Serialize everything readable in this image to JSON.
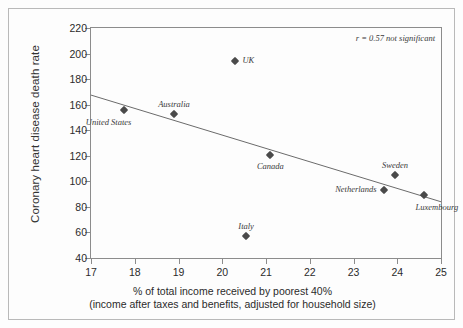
{
  "chart_data": {
    "type": "scatter",
    "title": "",
    "xlabel": "% of total income received by poorest 40%\n(income after taxes and benefits, adjusted for household size)",
    "xlabel_line1": "% of total income received by poorest 40%",
    "xlabel_line2": "(income after taxes and benefits, adjusted for household size)",
    "ylabel": "Coronary heart disease death rate",
    "xlim": [
      17,
      25
    ],
    "ylim": [
      40,
      220
    ],
    "xticks": [
      17,
      18,
      19,
      20,
      21,
      22,
      23,
      24,
      25
    ],
    "yticks": [
      40,
      60,
      80,
      100,
      120,
      140,
      160,
      180,
      200,
      220
    ],
    "grid": false,
    "legend": "none",
    "annotation": "r = 0.57 not significant",
    "marker_color": "#4a4a4a",
    "line_color": "#6b6b6b",
    "axis_color": "#8c8c8c",
    "points": [
      {
        "label": "United States",
        "x": 17.75,
        "y": 156,
        "label_pos": "below-left"
      },
      {
        "label": "Australia",
        "x": 18.9,
        "y": 152.5,
        "label_pos": "above"
      },
      {
        "label": "UK",
        "x": 20.3,
        "y": 194,
        "label_pos": "right"
      },
      {
        "label": "Italy",
        "x": 20.55,
        "y": 57,
        "label_pos": "above"
      },
      {
        "label": "Canada",
        "x": 21.1,
        "y": 121,
        "label_pos": "below"
      },
      {
        "label": "Netherlands",
        "x": 23.7,
        "y": 93,
        "label_pos": "left"
      },
      {
        "label": "Sweden",
        "x": 23.95,
        "y": 105,
        "label_pos": "above"
      },
      {
        "label": "Luxembourg",
        "x": 24.6,
        "y": 89,
        "label_pos": "below-right"
      }
    ],
    "trendline": {
      "x0": 17,
      "y0": 167.5,
      "x1": 25,
      "y1": 84
    }
  }
}
